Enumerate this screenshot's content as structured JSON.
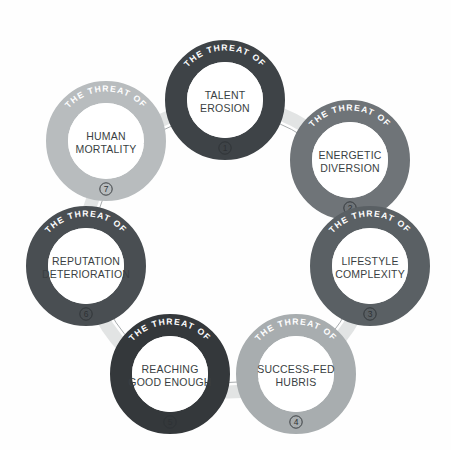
{
  "diagram": {
    "ring_label": "THE THREAT OF",
    "background": "#fefefe",
    "center_fill": "#ffffff",
    "band_color": "#e2e4e4",
    "band_line": "#8d9294",
    "nodes": [
      {
        "number": "1",
        "number_glyph": "①",
        "arc_label": "THE THREAT OF",
        "line1": "TALENT",
        "line2": "EROSION",
        "color": "#3e4347",
        "cx": 225,
        "cy": 100
      },
      {
        "number": "2",
        "number_glyph": "②",
        "arc_label": "THE THREAT OF",
        "line1": "ENERGETIC",
        "line2": "DIVERSION",
        "color": "#6f7478",
        "cx": 350,
        "cy": 160
      },
      {
        "number": "3",
        "number_glyph": "③",
        "arc_label": "THE THREAT OF",
        "line1": "LIFESTYLE",
        "line2": "COMPLEXITY",
        "color": "#5a6064",
        "cx": 370,
        "cy": 266
      },
      {
        "number": "4",
        "number_glyph": "④",
        "arc_label": "THE THREAT OF",
        "line1": "SUCCESS-FED",
        "line2": "HUBRIS",
        "color": "#a8adaf",
        "cx": 296,
        "cy": 374
      },
      {
        "number": "5",
        "number_glyph": "⑤",
        "arc_label": "THE THREAT OF",
        "line1": "REACHING",
        "line2": "GOOD ENOUGH",
        "color": "#34383b",
        "cx": 170,
        "cy": 374
      },
      {
        "number": "6",
        "number_glyph": "⑥",
        "arc_label": "THE THREAT OF",
        "line1": "REPUTATION",
        "line2": "DETERIORATION",
        "color": "#494e52",
        "cx": 86,
        "cy": 266
      },
      {
        "number": "7",
        "number_glyph": "⑦",
        "arc_label": "THE THREAT OF",
        "line1": "HUMAN",
        "line2": "MORTALITY",
        "color": "#b8bcbe",
        "cx": 106,
        "cy": 141
      }
    ]
  }
}
